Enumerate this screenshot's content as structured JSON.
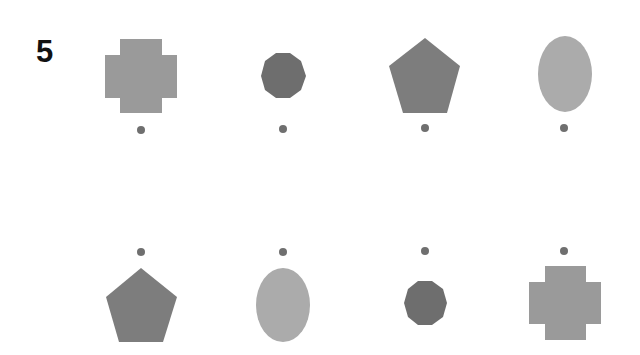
{
  "page": {
    "number": "5"
  },
  "colors": {
    "cross": "#9a9a9a",
    "decagon": "#6e6e6e",
    "pentagon": "#7d7d7d",
    "ellipse": "#ababab",
    "dot": "#6f6f6f"
  },
  "rows": [
    {
      "name": "top-row",
      "dot_position": "below",
      "items": [
        {
          "shape": "cross",
          "cx": 141,
          "cy": 76,
          "dot": [
            141,
            130
          ]
        },
        {
          "shape": "decagon",
          "cx": 283,
          "cy": 76,
          "dot": [
            283,
            129
          ]
        },
        {
          "shape": "pentagon",
          "cx": 425,
          "cy": 76,
          "dot": [
            425,
            128
          ]
        },
        {
          "shape": "ellipse",
          "cx": 565,
          "cy": 74,
          "dot": [
            564,
            128
          ]
        }
      ]
    },
    {
      "name": "bottom-row",
      "dot_position": "above",
      "items": [
        {
          "shape": "pentagon",
          "cx": 141,
          "cy": 305,
          "dot": [
            141,
            252
          ]
        },
        {
          "shape": "ellipse",
          "cx": 283,
          "cy": 305,
          "dot": [
            283,
            252
          ]
        },
        {
          "shape": "decagon",
          "cx": 425,
          "cy": 303,
          "dot": [
            425,
            251
          ]
        },
        {
          "shape": "cross",
          "cx": 565,
          "cy": 303,
          "dot": [
            564,
            251
          ]
        }
      ]
    }
  ]
}
